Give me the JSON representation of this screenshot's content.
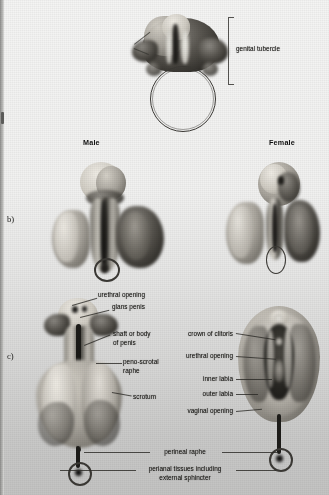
{
  "page": {
    "type": "scanned-textbook-illustration",
    "background_color": "#efefee",
    "ink_color": "#2c2b27"
  },
  "row_keys": [
    {
      "name": "row-key-b",
      "label": "b)"
    },
    {
      "name": "row-key-c",
      "label": "c)"
    }
  ],
  "row_a": {
    "figure_name": "undifferentiated-genital-tubercle-figure",
    "bracket_label": "genital tubercle"
  },
  "row_b": {
    "headers": [
      {
        "name": "column-header-male",
        "label": "Male"
      },
      {
        "name": "column-header-female",
        "label": "Female"
      }
    ],
    "figures": [
      {
        "name": "male-developing-genitalia-figure"
      },
      {
        "name": "female-developing-genitalia-figure"
      }
    ]
  },
  "row_c": {
    "male_labels": [
      {
        "name": "label-urethral-opening",
        "text": "urethral opening"
      },
      {
        "name": "label-glans-penis",
        "text": "glans penis"
      },
      {
        "name": "label-shaft-of-penis-line1",
        "text": "shaft or body"
      },
      {
        "name": "label-shaft-of-penis-line2",
        "text": "of penis"
      },
      {
        "name": "label-peno-scrotal-raphe-line1",
        "text": "peno-scrotal"
      },
      {
        "name": "label-peno-scrotal-raphe-line2",
        "text": "raphe"
      },
      {
        "name": "label-scrotum",
        "text": "scrotum"
      }
    ],
    "female_labels": [
      {
        "name": "label-crown-of-clitoris",
        "text": "crown of clitoris"
      },
      {
        "name": "label-urethral-opening-female",
        "text": "urethral opening"
      },
      {
        "name": "label-inner-labia",
        "text": "inner labia"
      },
      {
        "name": "label-outer-labia",
        "text": "outer labia"
      },
      {
        "name": "label-vaginal-opening",
        "text": "vaginal opening"
      }
    ],
    "shared_labels": [
      {
        "name": "label-perineal-raphe",
        "text": "perineal raphe"
      },
      {
        "name": "label-perianal-tissues-line1",
        "text": "perianal tissues including"
      },
      {
        "name": "label-perianal-tissues-line2",
        "text": "external sphincter"
      }
    ],
    "figures": [
      {
        "name": "male-mature-genitalia-figure"
      },
      {
        "name": "female-mature-genitalia-figure"
      }
    ]
  }
}
